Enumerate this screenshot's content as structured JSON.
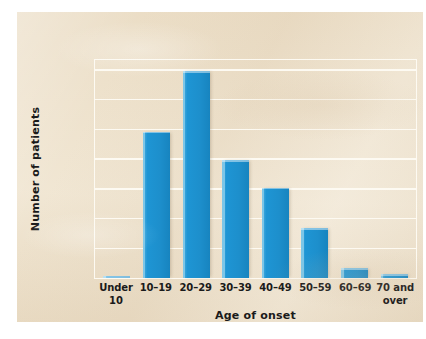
{
  "chart_data": {
    "type": "bar",
    "title": "",
    "subtitle": "",
    "xlabel": "Age of onset",
    "ylabel": "Number of patients",
    "categories": [
      "Under 10",
      "10–19",
      "20–29",
      "30–39",
      "40–49",
      "50–59",
      "60–69",
      "70 and over"
    ],
    "values": [
      4,
      295,
      417,
      238,
      182,
      100,
      20,
      8
    ],
    "series": [
      {
        "name": "Number of patients",
        "values": [
          4,
          295,
          417,
          238,
          182,
          100,
          20,
          8
        ]
      }
    ],
    "ylim": [
      0,
      440
    ],
    "yticks": [
      0,
      60,
      120,
      180,
      240,
      300,
      360,
      420
    ],
    "ytick_labels": [
      "0",
      "60",
      "120",
      "180",
      "240",
      "300",
      "360",
      "420"
    ],
    "grid": true,
    "grid_axis": "y",
    "grid_color": "#fdfaf2",
    "legend": false,
    "legend_position": "none",
    "bar_color": "#1d8fcc",
    "bar_highlight_color": "#7cc6e8",
    "background_color": "#ece0ca",
    "text_color": "#1a1a1a",
    "annotations": []
  }
}
